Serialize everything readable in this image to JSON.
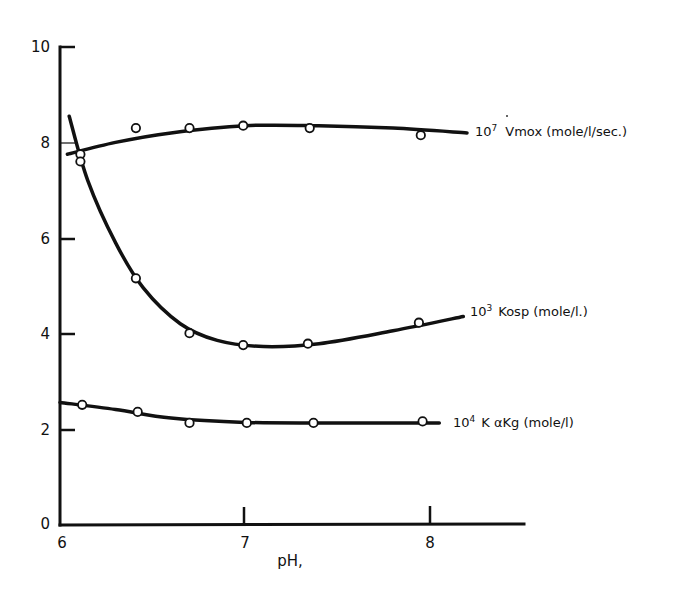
{
  "chart_data": {
    "type": "line",
    "title": "",
    "xlabel": "pH,",
    "ylabel": "",
    "xlim": [
      6,
      8.5
    ],
    "ylim": [
      0,
      10
    ],
    "x_ticks": [
      6,
      7,
      8
    ],
    "y_ticks": [
      0,
      2,
      4,
      6,
      8,
      10
    ],
    "grid": false,
    "legend_position": "inline-right",
    "series": [
      {
        "name": "10⁷ Vmox (mole/l/sec.)",
        "label_main": "10",
        "label_sup": "7",
        "label_rest": "Vmox (mole/l/sec.)",
        "points": [
          {
            "x": 6.11,
            "y": 7.75
          },
          {
            "x": 6.41,
            "y": 8.3
          },
          {
            "x": 6.7,
            "y": 8.3
          },
          {
            "x": 6.99,
            "y": 8.35
          },
          {
            "x": 7.35,
            "y": 8.3
          },
          {
            "x": 7.95,
            "y": 8.15
          }
        ],
        "curve": [
          {
            "x": 6.04,
            "y": 7.75
          },
          {
            "x": 6.3,
            "y": 8.0
          },
          {
            "x": 6.6,
            "y": 8.2
          },
          {
            "x": 7.0,
            "y": 8.35
          },
          {
            "x": 7.4,
            "y": 8.35
          },
          {
            "x": 7.8,
            "y": 8.3
          },
          {
            "x": 8.2,
            "y": 8.2
          }
        ]
      },
      {
        "name": "10³ Kosp (mole/l.)",
        "label_main": "10",
        "label_sup": "3",
        "label_rest": "Kosp (mole/l.)",
        "points": [
          {
            "x": 6.11,
            "y": 7.6
          },
          {
            "x": 6.41,
            "y": 5.15
          },
          {
            "x": 6.7,
            "y": 4.0
          },
          {
            "x": 6.99,
            "y": 3.75
          },
          {
            "x": 7.34,
            "y": 3.78
          },
          {
            "x": 7.94,
            "y": 4.22
          }
        ],
        "curve": [
          {
            "x": 6.05,
            "y": 8.55
          },
          {
            "x": 6.15,
            "y": 7.2
          },
          {
            "x": 6.3,
            "y": 5.9
          },
          {
            "x": 6.45,
            "y": 4.95
          },
          {
            "x": 6.65,
            "y": 4.2
          },
          {
            "x": 6.85,
            "y": 3.85
          },
          {
            "x": 7.1,
            "y": 3.72
          },
          {
            "x": 7.4,
            "y": 3.78
          },
          {
            "x": 7.8,
            "y": 4.05
          },
          {
            "x": 8.18,
            "y": 4.35
          }
        ]
      },
      {
        "name": "10⁴ K αKg (mole/l)",
        "label_main": "10",
        "label_sup": "4",
        "label_rest": "K αKg (mole/l)",
        "points": [
          {
            "x": 6.12,
            "y": 2.5
          },
          {
            "x": 6.42,
            "y": 2.35
          },
          {
            "x": 6.7,
            "y": 2.12
          },
          {
            "x": 7.01,
            "y": 2.12
          },
          {
            "x": 7.37,
            "y": 2.12
          },
          {
            "x": 7.96,
            "y": 2.15
          }
        ],
        "curve": [
          {
            "x": 6.0,
            "y": 2.55
          },
          {
            "x": 6.3,
            "y": 2.4
          },
          {
            "x": 6.6,
            "y": 2.22
          },
          {
            "x": 7.0,
            "y": 2.13
          },
          {
            "x": 7.5,
            "y": 2.12
          },
          {
            "x": 8.05,
            "y": 2.12
          }
        ]
      }
    ]
  },
  "labels": {
    "x_axis_title": "pH,",
    "y_ticks": [
      "0",
      "2",
      "4",
      "6",
      "8",
      "10"
    ],
    "x_ticks": [
      "6",
      "7",
      "8"
    ],
    "vmax_main": "10",
    "vmax_sup": "7",
    "vmax_rest": "Vmox (mole/l/sec.)",
    "kosp_main": "10",
    "kosp_sup": "3",
    "kosp_rest": "Kosp (mole/l.)",
    "kakg_main": "10",
    "kakg_sup": "4",
    "kakg_rest": "K αKg (mole/l)"
  }
}
